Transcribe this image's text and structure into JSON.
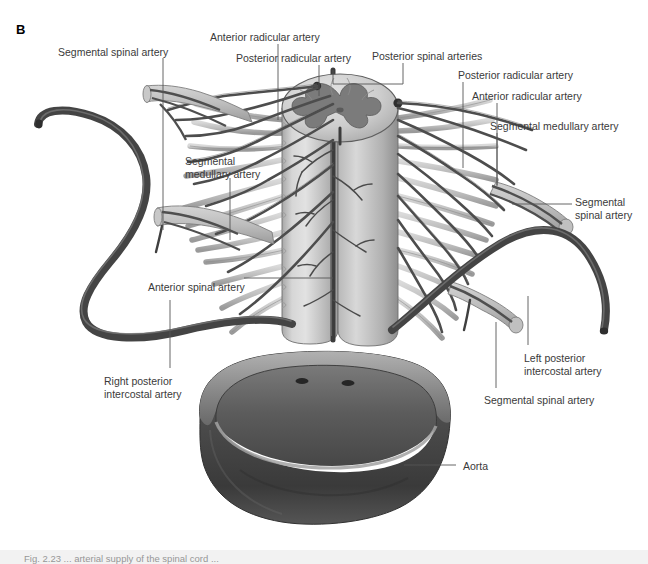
{
  "figure": {
    "panel_letter": "B",
    "background_color": "#ffffff",
    "label_color": "#3a3a3a",
    "leader_color": "#555555",
    "caption_strip_color": "#f2f2f2",
    "caption_text": "Fig. 2.23 ... arterial supply of the spinal cord ..."
  },
  "labels": [
    {
      "id": "segmental-spinal-artery-upper-left",
      "text": "Segmental spinal artery",
      "x": 58,
      "y": 46,
      "align": "left"
    },
    {
      "id": "anterior-radicular-artery-top",
      "text": "Anterior radicular artery",
      "x": 210,
      "y": 31,
      "align": "left"
    },
    {
      "id": "posterior-radicular-artery-top",
      "text": "Posterior radicular artery",
      "x": 236,
      "y": 52,
      "align": "left"
    },
    {
      "id": "posterior-spinal-arteries",
      "text": "Posterior spinal arteries",
      "x": 372,
      "y": 50,
      "align": "left"
    },
    {
      "id": "posterior-radicular-artery-right",
      "text": "Posterior radicular artery",
      "x": 458,
      "y": 69,
      "align": "left"
    },
    {
      "id": "anterior-radicular-artery-right",
      "text": "Anterior radicular artery",
      "x": 472,
      "y": 90,
      "align": "left"
    },
    {
      "id": "segmental-medullary-artery-right",
      "text": "Segmental medullary artery",
      "x": 490,
      "y": 120,
      "align": "left"
    },
    {
      "id": "segmental-medullary-artery-left",
      "text": "Segmental\nmedullary artery",
      "x": 185,
      "y": 155,
      "align": "left"
    },
    {
      "id": "segmental-spinal-artery-right",
      "text": "Segmental\nspinal artery",
      "x": 575,
      "y": 196,
      "align": "left"
    },
    {
      "id": "anterior-spinal-artery",
      "text": "Anterior spinal artery",
      "x": 148,
      "y": 281,
      "align": "left"
    },
    {
      "id": "left-posterior-intercostal-artery",
      "text": "Left posterior\nintercostal artery",
      "x": 524,
      "y": 352,
      "align": "left"
    },
    {
      "id": "right-posterior-intercostal-artery",
      "text": "Right posterior\nintercostal artery",
      "x": 104,
      "y": 375,
      "align": "left"
    },
    {
      "id": "segmental-spinal-artery-bottom",
      "text": "Segmental spinal artery",
      "x": 484,
      "y": 394,
      "align": "left"
    },
    {
      "id": "aorta",
      "text": "Aorta",
      "x": 463,
      "y": 460,
      "align": "left"
    }
  ],
  "leaders": [
    {
      "id": "leader-segmental-spinal-artery-upper-left",
      "points": "163,58 163,230"
    },
    {
      "id": "leader-anterior-radicular-artery-top",
      "points": "278,44 278,120"
    },
    {
      "id": "leader-posterior-radicular-artery-top",
      "points": "319,65 319,96"
    },
    {
      "id": "leader-posterior-spinal-arteries",
      "points": "403,63 403,84 333,84 333,70"
    },
    {
      "id": "leader-posterior-radicular-artery-right",
      "points": "463,82 463,168"
    },
    {
      "id": "leader-anterior-radicular-artery-right",
      "points": "497,103 497,185"
    },
    {
      "id": "leader-segmental-medullary-artery-right",
      "points": "497,133 497,186"
    },
    {
      "id": "leader-segmental-medullary-artery-left",
      "points": "230,178 230,240"
    },
    {
      "id": "leader-segmental-spinal-artery-right",
      "points": "572,204 512,204"
    },
    {
      "id": "leader-anterior-spinal-artery",
      "points": "244,278 333,278"
    },
    {
      "id": "leader-left-posterior-intercostal-artery",
      "points": "528,296 528,345"
    },
    {
      "id": "leader-right-posterior-intercostal-artery",
      "points": "170,300 170,368"
    },
    {
      "id": "leader-segmental-spinal-artery-bottom",
      "points": "496,322 496,388"
    },
    {
      "id": "leader-aorta",
      "points": "456,465 404,465"
    }
  ],
  "anatomy": {
    "spinal_cord": {
      "name": "spinal-cord-cylinder",
      "fill_light": "#cfcfcf",
      "fill_mid": "#b4b4b4",
      "fill_dark": "#9a9a9a",
      "gray_matter_color": "#7d7d7d",
      "outline_color": "#4a4a4a"
    },
    "aorta": {
      "name": "aorta-segment",
      "wall_fill": "#4a4a4a",
      "lumen_fill": "#6b6b6b",
      "rim_fill": "#8c8c8c",
      "ostia_fill": "#2b2b2b",
      "ostia_count": 2
    },
    "intercostal_arteries": {
      "name": "posterior-intercostal-arteries",
      "stroke": "#4b4b4b",
      "highlight": "#6f6f6f",
      "count": 2
    },
    "radicular_arteries": {
      "name": "radicular-arteries",
      "stroke": "#5a5a5a",
      "count_left": 9,
      "count_right": 9
    },
    "nerve_rootlets": {
      "name": "nerve-rootlets",
      "fill": "#c8c8c8",
      "outline": "#808080",
      "count_left": 18,
      "count_right": 18
    }
  }
}
